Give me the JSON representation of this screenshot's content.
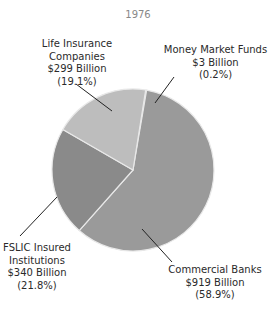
{
  "chart_data": {
    "type": "pie",
    "title": "1976",
    "categories": [
      "Money Market Funds",
      "Commercial Banks",
      "FSLIC Insured Institutions",
      "Life Insurance Companies"
    ],
    "values": [
      3,
      919,
      340,
      299
    ],
    "percentages": [
      0.2,
      58.9,
      21.8,
      19.1
    ],
    "unit": "Billion USD",
    "colors": [
      "#c9c9c9",
      "#9a9a9a",
      "#8a8a8a",
      "#bdbdbd"
    ],
    "labels": [
      {
        "name": "Money Market Funds",
        "amount": "$3 Billion",
        "pct": "(0.2%)"
      },
      {
        "name": "Commercial Banks",
        "amount": "$919 Billion",
        "pct": "(58.9%)"
      },
      {
        "name_line1": "FSLIC Insured",
        "name_line2": "Institutions",
        "amount": "$340 Billion",
        "pct": "(21.8%)"
      },
      {
        "name_line1": "Life Insurance",
        "name_line2": "Companies",
        "amount": "$299 Billion",
        "pct": "(19.1%)"
      }
    ],
    "legend": "none (callout labels)"
  }
}
